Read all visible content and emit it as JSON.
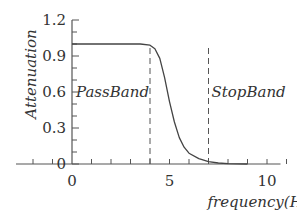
{
  "chart_data": {
    "type": "line",
    "title": "",
    "xlabel": "frequency(Hz)",
    "ylabel": "Attenuation",
    "xlim": [
      -2,
      11
    ],
    "ylim": [
      0,
      1.2
    ],
    "x_ticks": [
      -2,
      -1,
      0,
      1,
      2,
      3,
      4,
      5,
      6,
      7,
      8,
      9,
      10,
      11
    ],
    "x_tick_labels": [
      {
        "value": 0,
        "label": "0"
      },
      {
        "value": 5,
        "label": "5"
      },
      {
        "value": 10,
        "label": "10"
      }
    ],
    "y_ticks": [
      0,
      0.1,
      0.2,
      0.3,
      0.4,
      0.5,
      0.6,
      0.7,
      0.8,
      0.9,
      1.0,
      1.1,
      1.2
    ],
    "y_tick_labels": [
      {
        "value": 0,
        "label": "0"
      },
      {
        "value": 0.3,
        "label": "0.3"
      },
      {
        "value": 0.6,
        "label": "0.6"
      },
      {
        "value": 0.9,
        "label": "0.9"
      },
      {
        "value": 1.2,
        "label": "1.2"
      }
    ],
    "grid": false,
    "series": [
      {
        "name": "attenuation",
        "x": [
          0,
          1,
          2,
          3,
          3.5,
          4,
          4.25,
          4.5,
          4.75,
          5,
          5.25,
          5.5,
          5.75,
          6,
          6.5,
          7,
          7.5,
          8,
          8.5,
          9
        ],
        "y": [
          1.0,
          1.0,
          1.0,
          1.0,
          1.0,
          0.99,
          0.96,
          0.88,
          0.72,
          0.52,
          0.35,
          0.22,
          0.14,
          0.09,
          0.045,
          0.02,
          0.008,
          0.003,
          0.001,
          0.0
        ]
      }
    ],
    "vlines": [
      {
        "x": 4,
        "style": "dashed",
        "label": "PassBand",
        "label_side": "left"
      },
      {
        "x": 7,
        "style": "dashed",
        "label": "StopBand",
        "label_side": "right"
      }
    ],
    "annotations": [
      {
        "text": "PassBand",
        "x": 2,
        "y": 0.6
      },
      {
        "text": "StopBand",
        "x": 9,
        "y": 0.6
      }
    ]
  }
}
